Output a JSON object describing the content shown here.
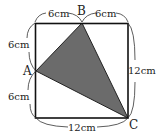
{
  "diagram": {
    "type": "geometry",
    "square": {
      "side_cm": 12,
      "stroke": "#111111"
    },
    "triangle": {
      "vertices": [
        "A",
        "B",
        "C"
      ],
      "fill": "#6b6b6b"
    },
    "points": {
      "A": {
        "label": "A",
        "position": "midpoint of left side"
      },
      "B": {
        "label": "B",
        "position": "midpoint of top side"
      },
      "C": {
        "label": "C",
        "position": "bottom-right corner"
      }
    },
    "dimensions": {
      "top_left": "6cm",
      "top_right": "6cm",
      "left_upper": "6cm",
      "left_lower": "6cm",
      "right": "12cm",
      "bottom": "12cm"
    }
  }
}
